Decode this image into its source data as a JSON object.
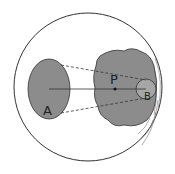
{
  "diagram": {
    "labels": {
      "a": "A",
      "p": "P",
      "b": "B"
    },
    "colors": {
      "background": "#ffffff",
      "outline": "#333333",
      "fill_grey": "#8c8c8c",
      "fill_light_grey": "#a6a6a6"
    }
  }
}
